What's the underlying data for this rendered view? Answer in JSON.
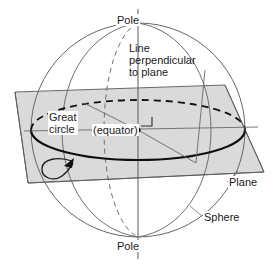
{
  "figure": {
    "labels": {
      "pole_top": "Pole",
      "pole_bottom": "Pole",
      "line_perpendicular": "Line\nperpendicular\nto plane",
      "great_circle": "Great\ncircle",
      "equator": "(equator)",
      "plane": "Plane",
      "sphere": "Sphere"
    },
    "colors": {
      "outline": "#555555",
      "heavy_outline": "#111111",
      "plane_fill": "#d9d9d9",
      "plane_edge": "#555555",
      "background": "#ffffff",
      "text": "#1a1a1a"
    },
    "geometry": {
      "sphere_center_x": 138,
      "sphere_center_y": 130,
      "sphere_radius": 107,
      "axis_top_y": 10,
      "axis_bottom_y": 258,
      "equator_rx": 107,
      "equator_ry": 30,
      "plane_corners": "15,92 225,85 264,172 28,183"
    },
    "elements": [
      "sphere-outline",
      "polar-axis",
      "front-meridian",
      "back-meridian-dashed",
      "equator-ellipse",
      "cutting-plane",
      "right-angle-marker",
      "direction-arrow-loop",
      "radius-leader-lines"
    ]
  }
}
